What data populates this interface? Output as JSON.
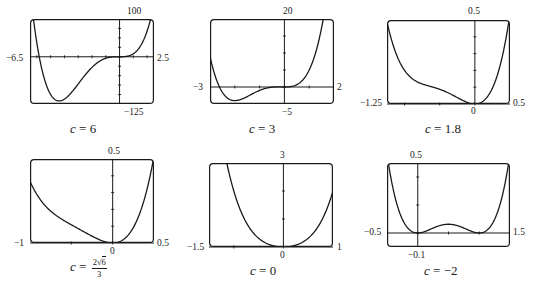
{
  "figure": {
    "function": "f(x) = x^4 + c x^3 + x^2",
    "panels": [
      {
        "id": "p1",
        "caption_var": "c",
        "caption_eq": " = ",
        "caption_val": "6",
        "x_min_label": "−6.5",
        "x_max_label": "2.5",
        "y_max_label": "100",
        "y_min_label": "−125"
      },
      {
        "id": "p2",
        "caption_var": "c",
        "caption_eq": " = ",
        "caption_val": "3",
        "x_min_label": "−3",
        "x_max_label": "2",
        "y_max_label": "20",
        "y_min_label": "−5"
      },
      {
        "id": "p3",
        "caption_var": "c",
        "caption_eq": " = ",
        "caption_val": "1.8",
        "x_min_label": "−1.25",
        "x_max_label": "0.5",
        "y_max_label": "0.5",
        "y_min_label": "0"
      },
      {
        "id": "p4",
        "caption_var": "c",
        "caption_eq": " = ",
        "caption_num": "2√6",
        "caption_num_coef": "2",
        "caption_num_rad": "6",
        "caption_den": "3",
        "x_min_label": "−1",
        "x_max_label": "0.5",
        "y_max_label": "0.5",
        "y_min_label": "0"
      },
      {
        "id": "p5",
        "caption_var": "c",
        "caption_eq": " = ",
        "caption_val": "0",
        "x_min_label": "−1.5",
        "x_max_label": "1",
        "y_max_label": "3",
        "y_min_label": "0"
      },
      {
        "id": "p6",
        "caption_var": "c",
        "caption_eq": " = ",
        "caption_val": "−2",
        "x_min_label": "−0.5",
        "x_max_label": "1.5",
        "y_max_label": "0.5",
        "y_min_label": "−0.1"
      }
    ]
  },
  "chart_data": [
    {
      "type": "line",
      "title": "c = 6",
      "function": "x^4 + 6x^3 + x^2",
      "c": 6,
      "xlim": [
        -6.5,
        2.5
      ],
      "ylim": [
        -125,
        100
      ],
      "x_tick_step": 1,
      "y_tick_step": 25,
      "grid": false,
      "x": [
        -6.5,
        -6,
        -5.5,
        -5,
        -4.5,
        -4.3,
        -4,
        -3.5,
        -3,
        -2.5,
        -2,
        -1.5,
        -1,
        -0.5,
        0,
        0.5,
        1,
        1.5,
        2,
        2.5
      ],
      "y": [
        68.1,
        0,
        -41.6,
        -100,
        -106.3,
        -117.3,
        -112,
        -98,
        -72,
        -47.5,
        -28,
        -12.9,
        -4,
        -0.4,
        0,
        1.1,
        8,
        27.6,
        68,
        137.8
      ]
    },
    {
      "type": "line",
      "title": "c = 3",
      "function": "x^4 + 3x^3 + x^2",
      "c": 3,
      "xlim": [
        -3,
        2
      ],
      "ylim": [
        -5,
        20
      ],
      "x_tick_step": 1,
      "y_tick_step": 5,
      "grid": false,
      "x": [
        -3,
        -2.5,
        -2,
        -1.5,
        -1,
        -0.5,
        0,
        0.5,
        1,
        1.5,
        2
      ],
      "y": [
        9,
        -0.6,
        -4,
        -3.7,
        -1,
        -0.06,
        0,
        0.69,
        5,
        17.4,
        44
      ]
    },
    {
      "type": "line",
      "title": "c = 1.8",
      "function": "x^4 + 1.8x^3 + x^2",
      "c": 1.8,
      "xlim": [
        -1.25,
        0.5
      ],
      "ylim": [
        0,
        0.5
      ],
      "x_tick_step": 0.5,
      "y_tick_step": 0.1,
      "grid": false,
      "x": [
        -1.25,
        -1,
        -0.75,
        -0.5,
        -0.25,
        0,
        0.25,
        0.5
      ],
      "y": [
        0.57,
        0.2,
        0.12,
        0.088,
        0.038,
        0,
        0.09,
        0.53
      ]
    },
    {
      "type": "line",
      "title": "c = 2√6/3",
      "function": "x^4 + (2√6/3)x^3 + x^2",
      "c": 1.633,
      "xlim": [
        -1,
        0.5
      ],
      "ylim": [
        0,
        0.5
      ],
      "x_tick_step": 0.5,
      "y_tick_step": 0.1,
      "grid": false,
      "x": [
        -1,
        -0.75,
        -0.5,
        -0.25,
        0,
        0.25,
        0.5
      ],
      "y": [
        0.37,
        0.19,
        0.108,
        0.041,
        0,
        0.092,
        0.516
      ]
    },
    {
      "type": "line",
      "title": "c = 0",
      "function": "x^4 + x^2",
      "c": 0,
      "xlim": [
        -1.5,
        1
      ],
      "ylim": [
        0,
        3
      ],
      "x_tick_step": 1,
      "y_tick_step": 1,
      "grid": false,
      "x": [
        -1.5,
        -1,
        -0.5,
        0,
        0.5,
        1
      ],
      "y": [
        7.31,
        2,
        0.31,
        0,
        0.31,
        2
      ]
    },
    {
      "type": "line",
      "title": "c = −2",
      "function": "x^4 − 2x^3 + x^2",
      "c": -2,
      "xlim": [
        -0.5,
        1.5
      ],
      "ylim": [
        -0.1,
        0.5
      ],
      "x_tick_step": 0.5,
      "y_tick_step": 0.2,
      "grid": false,
      "x": [
        -0.5,
        -0.25,
        0,
        0.25,
        0.5,
        0.75,
        1,
        1.25,
        1.5
      ],
      "y": [
        0.5625,
        0.098,
        0,
        0.035,
        0.0625,
        0.035,
        0,
        0.098,
        0.5625
      ]
    }
  ]
}
